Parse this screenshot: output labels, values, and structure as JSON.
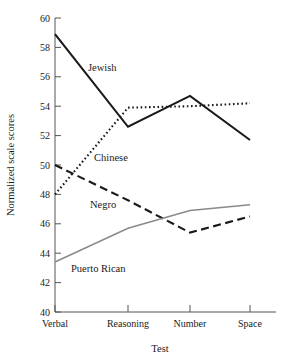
{
  "chart_data": {
    "type": "line",
    "title": "",
    "xlabel": "Test",
    "ylabel": "Normalized scale scores",
    "categories": [
      "Verbal",
      "Reasoning",
      "Number",
      "Space"
    ],
    "ylim": [
      40,
      60
    ],
    "yticks": [
      40,
      42,
      44,
      46,
      48,
      50,
      52,
      54,
      56,
      58,
      60
    ],
    "grid": false,
    "legend_position": "inline-annotations",
    "series": [
      {
        "name": "Jewish",
        "values": [
          58.9,
          52.6,
          54.7,
          51.7
        ],
        "style": "solid",
        "color": "#1a1a1a",
        "width": 2.1
      },
      {
        "name": "Chinese",
        "values": [
          48.0,
          53.9,
          54.0,
          54.2
        ],
        "style": "dotted",
        "color": "#1a1a1a",
        "width": 2.1
      },
      {
        "name": "Negro",
        "values": [
          50.0,
          47.6,
          45.4,
          46.5
        ],
        "style": "dashed",
        "color": "#1a1a1a",
        "width": 2.1
      },
      {
        "name": "Puerto Rican",
        "values": [
          43.4,
          45.7,
          46.9,
          47.3
        ],
        "style": "solid",
        "color": "#8a8a8a",
        "width": 1.5
      }
    ],
    "annotations": [
      {
        "text": "Jewish",
        "series": "Jewish",
        "x": 88,
        "y": 71
      },
      {
        "text": "Chinese",
        "series": "Chinese",
        "x": 94,
        "y": 161
      },
      {
        "text": "Negro",
        "series": "Negro",
        "x": 90,
        "y": 208
      },
      {
        "text": "Puerto Rican",
        "series": "Puerto Rican",
        "x": 71,
        "y": 272
      }
    ],
    "ytick_labels": [
      "40",
      "42",
      "44",
      "46",
      "48",
      "50",
      "52",
      "54",
      "56",
      "58",
      "60"
    ],
    "xtick_labels": [
      "Verbal",
      "Reasoning",
      "Number",
      "Space"
    ]
  }
}
